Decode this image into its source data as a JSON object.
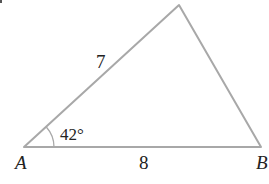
{
  "diagram": {
    "type": "triangle",
    "vertices": {
      "A": {
        "label": "A",
        "x": 24,
        "y": 147
      },
      "B": {
        "label": "B",
        "x": 261,
        "y": 147
      },
      "C": {
        "label": "",
        "x": 179,
        "y": 5
      }
    },
    "sides": {
      "AC": {
        "label": "7"
      },
      "AB": {
        "label": "8"
      }
    },
    "angles": {
      "A": {
        "label": "42°"
      }
    },
    "colors": {
      "stroke": "#a8a8a8",
      "text": "#222222"
    }
  }
}
